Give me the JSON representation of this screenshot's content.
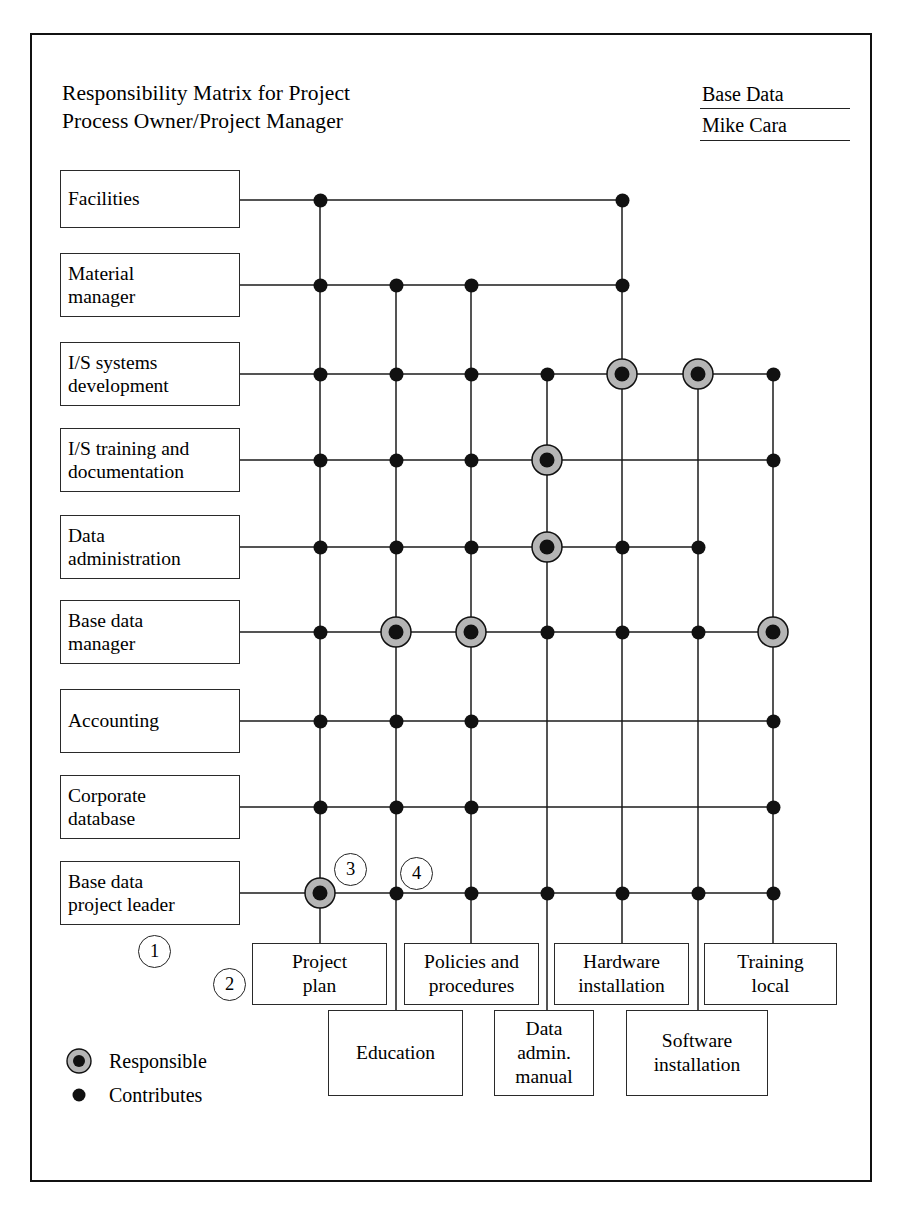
{
  "header": {
    "title_line1": "Responsibility Matrix for Project",
    "title_line2": "Process Owner/Project Manager",
    "field_label": "Base Data",
    "field_value": "Mike Cara"
  },
  "legend": {
    "responsible_label": "Responsible",
    "contributes_label": "Contributes",
    "responsible_fill": "#b5b5b5",
    "dot_color": "#111111"
  },
  "callouts": [
    {
      "number": "1",
      "x": 138,
      "y": 935
    },
    {
      "number": "2",
      "x": 213,
      "y": 968
    },
    {
      "number": "3",
      "x": 334,
      "y": 853
    },
    {
      "number": "4",
      "x": 400,
      "y": 857
    }
  ],
  "chart_data": {
    "type": "table",
    "title": "Responsibility Matrix for Project",
    "rows": [
      "Facilities",
      "Material manager",
      "I/S systems development",
      "I/S training and documentation",
      "Data administration",
      "Base data manager",
      "Accounting",
      "Corporate database",
      "Base data project leader"
    ],
    "columns": [
      "Project plan",
      "Education",
      "Policies and procedures",
      "Data admin. manual",
      "Hardware installation",
      "Software installation",
      "Training local"
    ],
    "legend": {
      "R": "Responsible",
      "C": "Contributes",
      "": "none"
    },
    "matrix": [
      [
        "C",
        "",
        "",
        "",
        "C",
        "",
        ""
      ],
      [
        "C",
        "C",
        "C",
        "",
        "C",
        "",
        ""
      ],
      [
        "C",
        "C",
        "C",
        "C",
        "R",
        "R",
        "C"
      ],
      [
        "C",
        "C",
        "C",
        "R",
        "",
        "",
        "C"
      ],
      [
        "C",
        "C",
        "C",
        "R",
        "C",
        "C",
        ""
      ],
      [
        "C",
        "R",
        "R",
        "C",
        "C",
        "C",
        "R"
      ],
      [
        "C",
        "C",
        "C",
        "",
        "",
        "",
        "C"
      ],
      [
        "C",
        "C",
        "C",
        "",
        "",
        "",
        "C"
      ],
      [
        "R",
        "C",
        "C",
        "C",
        "C",
        "C",
        "C"
      ]
    ]
  },
  "rows": [
    {
      "label": "Facilities"
    },
    {
      "label": "Material\nmanager"
    },
    {
      "label": "I/S systems\ndevelopment"
    },
    {
      "label": "I/S training and\ndocumentation"
    },
    {
      "label": "Data\nadministration"
    },
    {
      "label": "Base data\nmanager"
    },
    {
      "label": "Accounting"
    },
    {
      "label": "Corporate\ndatabase"
    },
    {
      "label": "Base data\nproject leader"
    }
  ],
  "columns": [
    {
      "label": "Project\nplan"
    },
    {
      "label": "Education"
    },
    {
      "label": "Policies and\nprocedures"
    },
    {
      "label": "Data\nadmin.\nmanual"
    },
    {
      "label": "Hardware\ninstallation"
    },
    {
      "label": "Software\ninstallation"
    },
    {
      "label": "Training\nlocal"
    }
  ]
}
